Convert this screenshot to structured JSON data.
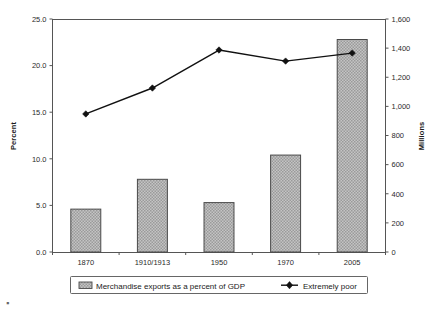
{
  "chart_data": {
    "type": "bar",
    "title": "",
    "subtitle": "",
    "categories": [
      "1870",
      "1910/1913",
      "1950",
      "1970",
      "2005"
    ],
    "xlabel": "",
    "grid": false,
    "legend_position": "bottom",
    "axes": {
      "left": {
        "label": "Percent",
        "ylim": [
          0.0,
          25.0
        ],
        "tick_step": 5.0,
        "ticks": [
          "0.0",
          "5.0",
          "10.0",
          "15.0",
          "20.0",
          "25.0"
        ],
        "tick_values": [
          0.0,
          5.0,
          10.0,
          15.0,
          20.0,
          25.0
        ]
      },
      "right": {
        "label": "Millions",
        "ylim": [
          0,
          1600
        ],
        "tick_step": 200,
        "ticks": [
          "0",
          "200",
          "400",
          "600",
          "800",
          "1,000",
          "1,200",
          "1,400",
          "1,600"
        ],
        "tick_values": [
          0,
          200,
          400,
          600,
          800,
          1000,
          1200,
          1400,
          1600
        ]
      }
    },
    "series": [
      {
        "name": "Merchandise exports as a percent of GDP",
        "type": "bar",
        "axis": "left",
        "values": [
          4.6,
          7.8,
          5.3,
          10.4,
          22.8
        ],
        "fill": "#b3b3b3",
        "stroke": "#4a4a4a",
        "pattern": "checker-hatch"
      },
      {
        "name": "Extremely poor",
        "type": "line",
        "axis": "right",
        "values": [
          948,
          1126,
          1387,
          1311,
          1366
        ],
        "stroke": "#111111",
        "marker": "diamond"
      }
    ]
  },
  "legend": {
    "items": [
      {
        "label": "Merchandise exports as a percent of GDP",
        "swatch": "bar-swatch"
      },
      {
        "label": "Extremely poor",
        "swatch": "line-marker-swatch"
      }
    ]
  },
  "colors": {
    "bar_fill": "#b3b3b3",
    "bar_stroke": "#4a4a4a",
    "line": "#111111",
    "axis": "#555555",
    "background": "#ffffff"
  }
}
